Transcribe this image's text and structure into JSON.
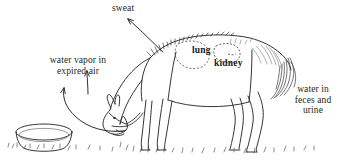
{
  "figure": {
    "background_color": "#ffffff",
    "ink_color": "#231f20",
    "labels": [
      {
        "id": "sweat",
        "text": "sweat",
        "style": "plain",
        "align": "left",
        "x": 112,
        "y": 3
      },
      {
        "id": "water-vapor-expired-air",
        "text": "water vapor in\nexpired air",
        "style": "plain",
        "align": "center",
        "x": 39,
        "y": 55
      },
      {
        "id": "water-feces-urine",
        "text": "water in\nfeces and\nurine",
        "style": "plain",
        "align": "center",
        "x": 286,
        "y": 84
      },
      {
        "id": "lung",
        "text": "lung",
        "style": "bold",
        "align": "left",
        "x": 192,
        "y": 45
      },
      {
        "id": "kidney",
        "text": "kidney",
        "style": "bold",
        "align": "left",
        "x": 214,
        "y": 58
      }
    ],
    "arrows": [
      {
        "id": "sweat-arrow",
        "label": "sweat",
        "direction": "up-left",
        "from": [
          163,
          52
        ],
        "to": [
          126,
          17
        ],
        "kind": "straight"
      },
      {
        "id": "expired-air-arrow",
        "label": "water vapor in expired air",
        "direction": "up",
        "from": [
          88,
          93
        ],
        "to": [
          87,
          69
        ],
        "kind": "straight"
      },
      {
        "id": "water-intake-arrow",
        "label": "water intake from trough",
        "direction": "up-left",
        "from": [
          123,
          129
        ],
        "to": [
          65,
          86
        ],
        "kind": "curved"
      }
    ],
    "drawing_elements": [
      {
        "id": "horse",
        "name": "grazing horse"
      },
      {
        "id": "water-trough",
        "name": "water trough"
      },
      {
        "id": "lung-outline",
        "name": "lung dashed outline"
      },
      {
        "id": "kidney-outline",
        "name": "kidney dashed outline"
      },
      {
        "id": "ground-grass",
        "name": "grass tufts on ground"
      }
    ]
  }
}
